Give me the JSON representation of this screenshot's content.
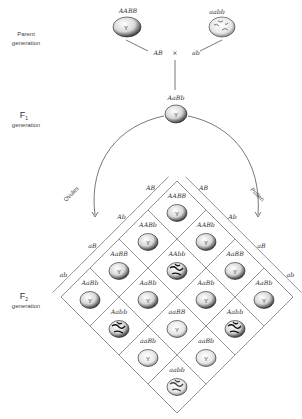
{
  "labels": {
    "parent_gen_1": "Parent",
    "parent_gen_2": "generation",
    "f1_gen_1": "F",
    "f1_gen_sub": "1",
    "f1_gen_2": "generation",
    "f2_gen_1": "F",
    "f2_gen_sub": "2",
    "f2_gen_2": "generation",
    "ovules": "Ovules",
    "pollen": "Pollen",
    "cross": "×"
  },
  "parents": [
    {
      "genotype": "AABB",
      "phenotype": "yellow-round",
      "gamete": "AB"
    },
    {
      "genotype": "aabb",
      "phenotype": "green-wrinkled",
      "gamete": "ab"
    }
  ],
  "f1": {
    "genotype": "AaBb",
    "phenotype": "yellow-round"
  },
  "seed_mark": "Y",
  "ovule_gametes": [
    "AB",
    "Ab",
    "aB",
    "ab"
  ],
  "pollen_gametes": [
    "AB",
    "Ab",
    "aB",
    "ab"
  ],
  "f2_grid": [
    [
      "AABB",
      "AABb",
      "AaBB",
      "AaBb"
    ],
    [
      "AABb",
      "AAbb",
      "AaBb",
      "Aabb"
    ],
    [
      "AaBB",
      "AaBb",
      "aaBB",
      "aaBb"
    ],
    [
      "AaBb",
      "Aabb",
      "aaBb",
      "aabb"
    ]
  ]
}
